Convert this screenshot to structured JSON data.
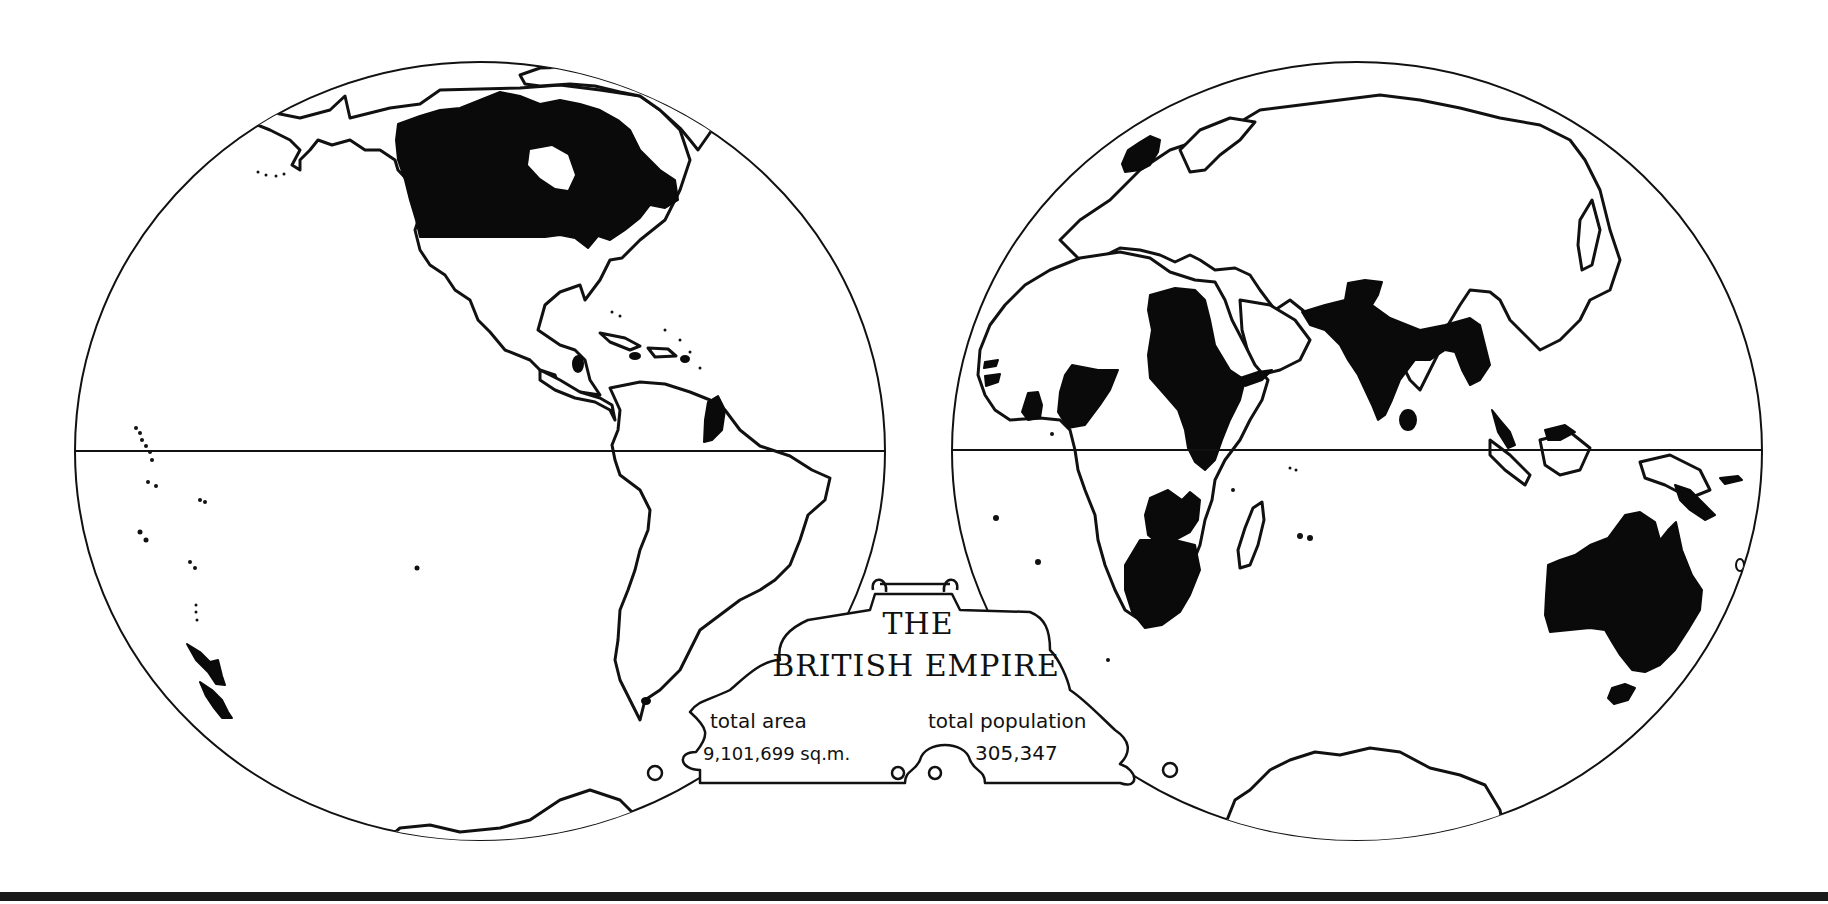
{
  "map": {
    "title_line1": "THE",
    "title_line2": "BRITISH EMPIRE",
    "total_area_label": "total area",
    "total_area_value": "9,101,699 sq.m.",
    "total_population_label": "total population",
    "total_population_value": "305,347",
    "projection": "two-hemisphere",
    "hemispheres": [
      "western-hemisphere",
      "eastern-hemisphere"
    ],
    "legend": {
      "empire_fill": "#0a0a0a",
      "other_land_fill": "#ffffff",
      "outline": "#111111"
    },
    "highlighted_territories": [
      "Canada",
      "British Honduras",
      "British Guiana",
      "Caribbean islands",
      "New Zealand",
      "Pacific islands",
      "Falkland Islands",
      "United Kingdom",
      "Egypt / Anglo-Egyptian Sudan",
      "East Africa",
      "Nigeria",
      "Gold Coast",
      "Sierra Leone / Gambia",
      "Rhodesia",
      "South Africa",
      "India",
      "Ceylon",
      "Burma",
      "Malaya",
      "Borneo",
      "New Guinea",
      "Australia",
      "Tasmania",
      "Aden"
    ]
  }
}
